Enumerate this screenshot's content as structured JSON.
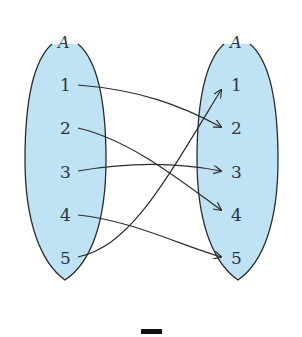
{
  "diagram": {
    "type": "function-mapping",
    "fill_color": "#bfe3f5",
    "stroke_color": "#2b2b2b",
    "domain_set": {
      "label": "A",
      "elements": [
        "1",
        "2",
        "3",
        "4",
        "5"
      ]
    },
    "codomain_set": {
      "label": "A",
      "elements": [
        "1",
        "2",
        "3",
        "4",
        "5"
      ]
    },
    "mappings": [
      {
        "from": "1",
        "to": "2"
      },
      {
        "from": "2",
        "to": "4"
      },
      {
        "from": "3",
        "to": "3"
      },
      {
        "from": "4",
        "to": "5"
      },
      {
        "from": "5",
        "to": "1"
      }
    ],
    "caption": "ㄱ"
  }
}
